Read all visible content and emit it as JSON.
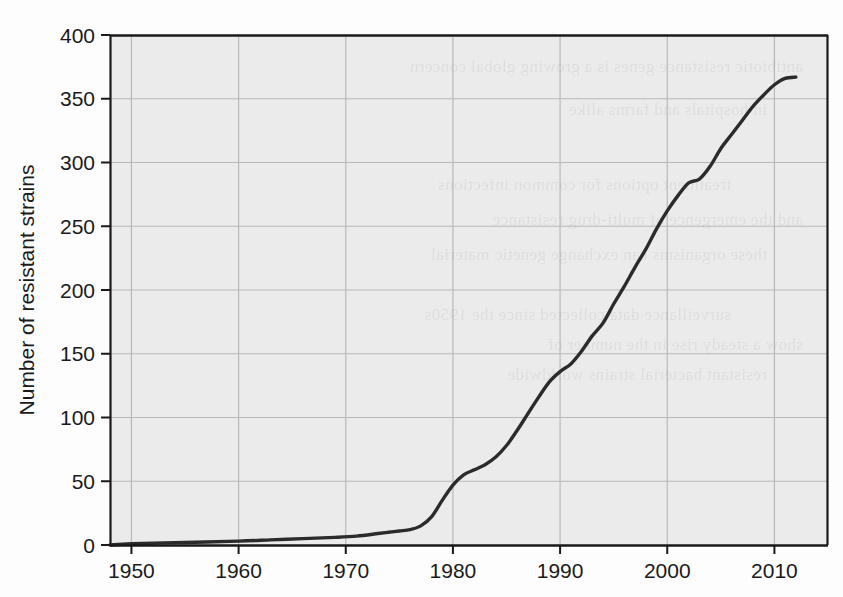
{
  "figure": {
    "background_color": "#fdfdfd",
    "plot_background_color": "#ebebeb",
    "grid_color": "#b9b9b9",
    "axis_color": "#1a1a1a",
    "line_color": "#2b2b2b"
  },
  "bleed_through_text": [
    "antibiotic resistance genes is a growing global concern",
    "in hospitals and farms alike",
    "treatment options for common infections",
    "and the emergence of multi-drug resistance",
    "these organisms can exchange genetic material",
    "surveillance data collected since the 1950s",
    "show a steady rise in the number of",
    "resistant bacterial strains worldwide"
  ],
  "chart_data": {
    "type": "line",
    "title": "",
    "xlabel": "",
    "ylabel": "Number of resistant strains",
    "xlim": [
      1948,
      2015
    ],
    "ylim": [
      0,
      400
    ],
    "grid": true,
    "legend": "none",
    "xticks": [
      1950,
      1960,
      1970,
      1980,
      1990,
      2000,
      2010
    ],
    "xtick_labels": [
      "1950",
      "1960",
      "1970",
      "1980",
      "1990",
      "2000",
      "2010"
    ],
    "yticks": [
      0,
      50,
      100,
      150,
      200,
      250,
      300,
      350,
      400
    ],
    "ytick_labels": [
      "0",
      "50",
      "100",
      "150",
      "200",
      "250",
      "300",
      "350",
      "400"
    ],
    "series": [
      {
        "name": "Resistant strains",
        "x": [
          1948,
          1950,
          1955,
          1960,
          1963,
          1966,
          1969,
          1971,
          1973,
          1974,
          1975,
          1976,
          1977,
          1978,
          1979,
          1980,
          1981,
          1982,
          1983,
          1984,
          1985,
          1986,
          1987,
          1988,
          1989,
          1990,
          1991,
          1992,
          1993,
          1994,
          1995,
          1996,
          1997,
          1998,
          1999,
          2000,
          2001,
          2002,
          2003,
          2004,
          2005,
          2006,
          2007,
          2008,
          2009,
          2010,
          2011,
          2012
        ],
        "y": [
          0,
          1,
          2,
          3,
          4,
          5,
          6,
          7,
          9,
          10,
          11,
          12,
          15,
          22,
          35,
          47,
          55,
          59,
          63,
          69,
          78,
          90,
          103,
          116,
          128,
          136,
          142,
          152,
          164,
          174,
          189,
          203,
          218,
          232,
          248,
          262,
          274,
          284,
          287,
          297,
          311,
          322,
          333,
          344,
          353,
          361,
          366,
          367
        ]
      }
    ]
  }
}
